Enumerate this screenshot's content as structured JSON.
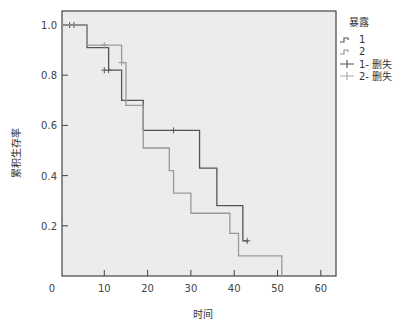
{
  "chart_data": {
    "type": "line",
    "subtype": "kaplan-meier-step",
    "title": "",
    "xlabel": "时间",
    "ylabel": "累积生存率",
    "xlim": [
      0,
      63
    ],
    "ylim": [
      0,
      1.05
    ],
    "x_ticks": [
      0,
      10,
      20,
      30,
      40,
      50,
      60
    ],
    "x_tick_labels": [
      "0",
      "10",
      "20",
      "30",
      "40",
      "50",
      "60"
    ],
    "y_ticks": [
      0.2,
      0.4,
      0.6,
      0.8,
      1.0
    ],
    "y_tick_labels": [
      "0.2",
      "0.4",
      "0.6",
      "0.8",
      "1.0"
    ],
    "grid": false,
    "legend": {
      "title": "暴露",
      "position": "right",
      "entries": [
        "1",
        "2",
        "1- 删失",
        "2- 删失"
      ]
    },
    "series": [
      {
        "name": "1",
        "color": "#555555",
        "steps": [
          [
            0,
            1.0
          ],
          [
            6,
            0.91
          ],
          [
            11,
            0.82
          ],
          [
            14,
            0.7
          ],
          [
            19,
            0.58
          ],
          [
            32,
            0.43
          ],
          [
            36,
            0.28
          ],
          [
            42,
            0.14
          ]
        ],
        "end_x": 43,
        "censored": [
          [
            2,
            1.0
          ],
          [
            3,
            1.0
          ],
          [
            10,
            0.82
          ],
          [
            11,
            0.82
          ],
          [
            26,
            0.58
          ],
          [
            43,
            0.14
          ]
        ]
      },
      {
        "name": "2",
        "color": "#999999",
        "steps": [
          [
            0,
            1.0
          ],
          [
            6,
            0.92
          ],
          [
            14,
            0.85
          ],
          [
            15,
            0.68
          ],
          [
            19,
            0.51
          ],
          [
            25,
            0.42
          ],
          [
            26,
            0.33
          ],
          [
            30,
            0.25
          ],
          [
            39,
            0.17
          ],
          [
            41,
            0.08
          ],
          [
            51,
            0.0
          ]
        ],
        "end_x": 51,
        "censored": [
          [
            10,
            0.92
          ],
          [
            14,
            0.85
          ]
        ]
      }
    ]
  }
}
